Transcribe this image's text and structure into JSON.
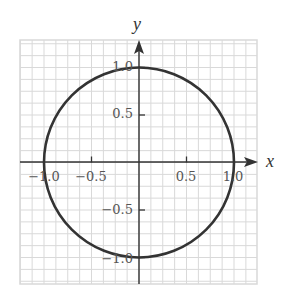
{
  "chart_data": {
    "type": "line",
    "title": "",
    "xlabel": "x",
    "ylabel": "y",
    "xlim": [
      -1.25,
      1.25
    ],
    "ylim": [
      -1.25,
      1.25
    ],
    "grid": true,
    "grid_step": 0.125,
    "legend": null,
    "series": [
      {
        "name": "unit circle",
        "equation": "x^2 + y^2 = 1",
        "center": [
          0,
          0
        ],
        "radius": 1.0,
        "color": "#333333"
      }
    ],
    "x_ticks": [
      {
        "value": -1.0,
        "label": "−1.0"
      },
      {
        "value": -0.5,
        "label": "−0.5"
      },
      {
        "value": 0.5,
        "label": "0.5"
      },
      {
        "value": 1.0,
        "label": "1.0"
      }
    ],
    "y_ticks": [
      {
        "value": 1.0,
        "label": "1.0"
      },
      {
        "value": 0.5,
        "label": "0.5"
      },
      {
        "value": -0.5,
        "label": "−0.5"
      },
      {
        "value": -1.0,
        "label": "−1.0"
      }
    ]
  },
  "axes": {
    "x_label": "x",
    "y_label": "y",
    "x_tick_labels": [
      "−1.0",
      "−0.5",
      "0.5",
      "1.0"
    ],
    "y_tick_labels": [
      "1.0",
      "0.5",
      "−0.5",
      "−1.0"
    ]
  },
  "colors": {
    "grid": "#d9d9d9",
    "axis": "#333333",
    "curve": "#333333",
    "labels": "#555555"
  }
}
